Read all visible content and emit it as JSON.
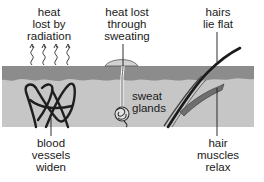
{
  "diagram": {
    "colors": {
      "background": "#ffffff",
      "epidermis": "#8c8c8c",
      "dermis": "#c6c6c6",
      "lines": "#1a1a1a",
      "text": "#1a1a1a"
    },
    "labels": {
      "radiation": [
        "heat",
        "lost by",
        "radiation"
      ],
      "sweating": [
        "heat lost",
        "through",
        "sweating"
      ],
      "hairs": [
        "hairs",
        "lie flat"
      ],
      "sweat_glands": [
        "sweat",
        "glands"
      ],
      "blood_vessels": [
        "blood",
        "vessels",
        "widen"
      ],
      "hair_muscles": [
        "hair",
        "muscles",
        "relax"
      ]
    },
    "parts": [
      {
        "name": "heat-radiation-arrows",
        "count": 4
      },
      {
        "name": "sweat-pore-droplet"
      },
      {
        "name": "sweat-gland-duct"
      },
      {
        "name": "sweat-gland-coil"
      },
      {
        "name": "blood-vessel-network"
      },
      {
        "name": "hair-shaft"
      },
      {
        "name": "hair-erector-muscle"
      },
      {
        "name": "epidermis-layer"
      },
      {
        "name": "dermis-layer"
      }
    ]
  }
}
